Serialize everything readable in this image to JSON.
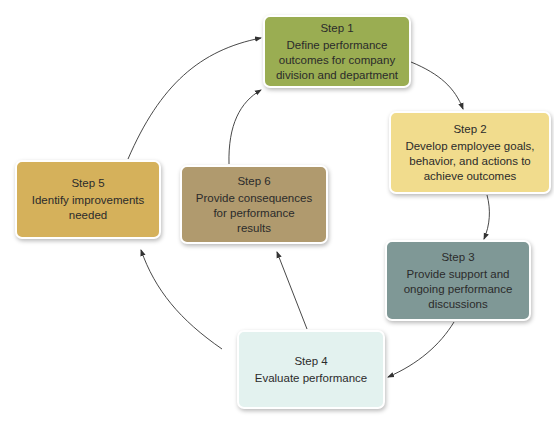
{
  "diagram": {
    "type": "cycle",
    "steps": [
      {
        "id": 1,
        "title": "Step 1",
        "description": "Define performance\noutcomes for company\ndivision and department",
        "color": "#9aad52"
      },
      {
        "id": 2,
        "title": "Step 2",
        "description": "Develop employee goals,\nbehavior, and actions to\nachieve outcomes",
        "color": "#f1dc8d"
      },
      {
        "id": 3,
        "title": "Step 3",
        "description": "Provide support and\nongoing performance\ndiscussions",
        "color": "#7f9896"
      },
      {
        "id": 4,
        "title": "Step 4",
        "description": "Evaluate performance",
        "color": "#e3f2ef"
      },
      {
        "id": 5,
        "title": "Step 5",
        "description": "Identify improvements\nneeded",
        "color": "#d5b15b"
      },
      {
        "id": 6,
        "title": "Step 6",
        "description": "Provide consequences\nfor performance\nresults",
        "color": "#b09a6e"
      }
    ],
    "connections": [
      {
        "from": 1,
        "to": 2
      },
      {
        "from": 2,
        "to": 3
      },
      {
        "from": 3,
        "to": 4
      },
      {
        "from": 4,
        "to": 5
      },
      {
        "from": 4,
        "to": 6
      },
      {
        "from": 5,
        "to": 1
      },
      {
        "from": 6,
        "to": 1
      }
    ],
    "arrow_color": "#333333"
  }
}
